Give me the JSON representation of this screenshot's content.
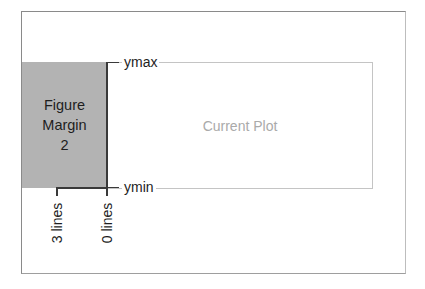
{
  "diagram": {
    "margin_box": {
      "lines": [
        "Figure",
        "Margin",
        "2"
      ],
      "color": "#b3b3b3"
    },
    "plot_region": {
      "label": "Current Plot",
      "label_color": "#aaaaaa"
    },
    "y_labels": {
      "top": "ymax",
      "bottom": "ymin"
    },
    "margin_ticks": [
      {
        "label": "3 lines"
      },
      {
        "label": "0 lines"
      }
    ]
  }
}
